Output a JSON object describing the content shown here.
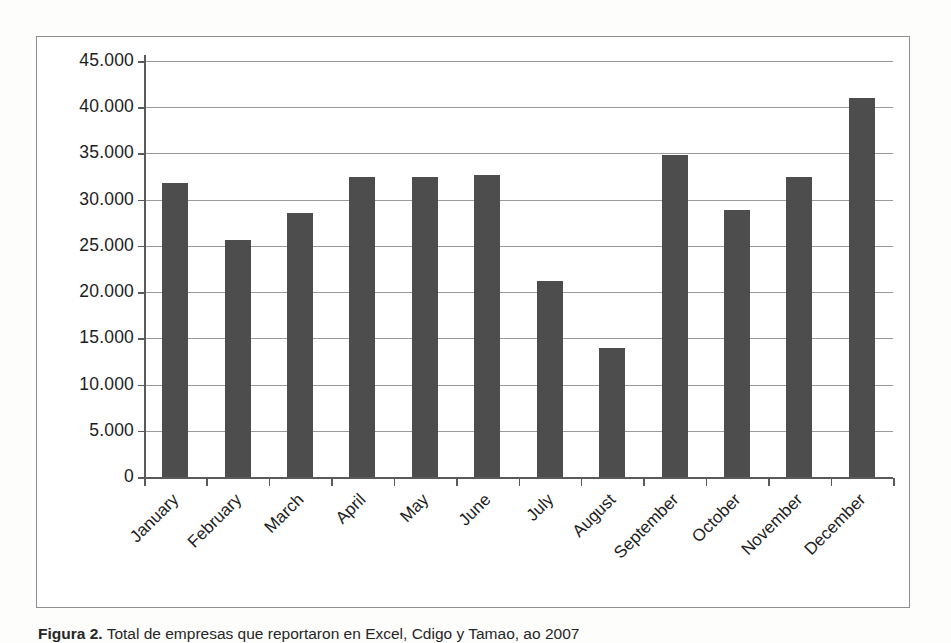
{
  "figure": {
    "caption_label": "Figura 2.",
    "caption_text": "Total de empresas que reportaron en Excel, Cdigo y Tamao, ao 2007"
  },
  "chart_data": {
    "type": "bar",
    "title": "",
    "subtitle": "",
    "xlabel": "",
    "ylabel": "",
    "categories": [
      "January",
      "February",
      "March",
      "April",
      "May",
      "June",
      "July",
      "August",
      "September",
      "October",
      "November",
      "December"
    ],
    "values": [
      31800,
      25600,
      28600,
      32500,
      32500,
      32700,
      21200,
      14000,
      34800,
      28900,
      32400,
      41000
    ],
    "ylim": [
      0,
      45000
    ],
    "ytick_values": [
      0,
      5000,
      10000,
      15000,
      20000,
      25000,
      30000,
      35000,
      40000,
      45000
    ],
    "ytick_labels": [
      "0",
      "5.000",
      "10.000",
      "15.000",
      "20.000",
      "25.000",
      "30.000",
      "35.000",
      "40.000",
      "45.000"
    ],
    "grid": true,
    "legend": "none",
    "bar_color": "#4d4d4d",
    "gridline_color": "#9a9a9a",
    "axis_color": "#5a5a5a",
    "frame_color": "#8e8e8e",
    "xtick_label_rotation": -45
  }
}
